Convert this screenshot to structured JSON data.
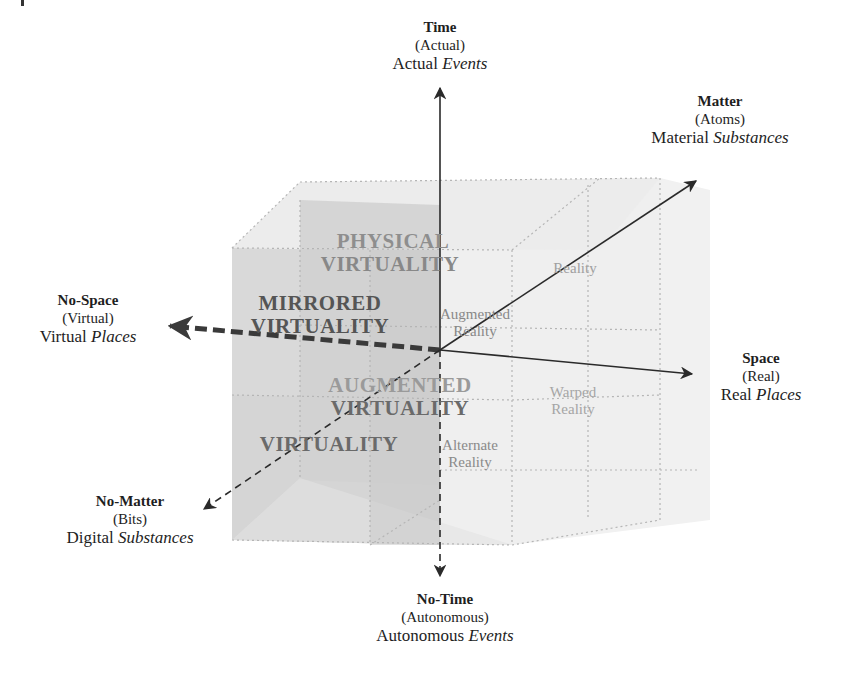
{
  "axes": {
    "time": {
      "title": "Time",
      "subtitle": "(Actual)",
      "desc_plain": "Actual",
      "desc_italic": "Events"
    },
    "no_time": {
      "title": "No-Time",
      "subtitle": "(Autonomous)",
      "desc_plain": "Autonomous",
      "desc_italic": "Events"
    },
    "matter": {
      "title": "Matter",
      "subtitle": "(Atoms)",
      "desc_plain": "Material",
      "desc_italic": "Substances"
    },
    "no_matter": {
      "title": "No-Matter",
      "subtitle": "(Bits)",
      "desc_plain": "Digital",
      "desc_italic": "Substances"
    },
    "space": {
      "title": "Space",
      "subtitle": "(Real)",
      "desc_plain": "Real",
      "desc_italic": "Places"
    },
    "no_space": {
      "title": "No-Space",
      "subtitle": "(Virtual)",
      "desc_plain": "Virtual",
      "desc_italic": "Places"
    }
  },
  "cells": {
    "physical_virtuality": {
      "line1": "PHYSICAL",
      "line2": "VIRTUALITY"
    },
    "mirrored_virtuality": {
      "line1": "MIRRORED",
      "line2": "VIRTUALITY"
    },
    "augmented_virtuality": {
      "line1": "AUGMENTED",
      "line2": "VIRTUALITY"
    },
    "virtuality": {
      "line1": "VIRTUALITY"
    },
    "reality": {
      "line1": "Reality"
    },
    "augmented_reality": {
      "line1": "Augmented",
      "line2": "Reality"
    },
    "warped_reality": {
      "line1": "Warped",
      "line2": "Reality"
    },
    "alternate_reality": {
      "line1": "Alternate",
      "line2": "Reality"
    }
  },
  "colors": {
    "axis": "#2a2a2a",
    "cube_dark": "#c9c9c9",
    "cube_mid": "#dcdcdc",
    "cube_light": "#ececec",
    "virtual_text": "#555555",
    "faded_text": "#8f8f8f",
    "reality_text": "#9a9a9a"
  }
}
